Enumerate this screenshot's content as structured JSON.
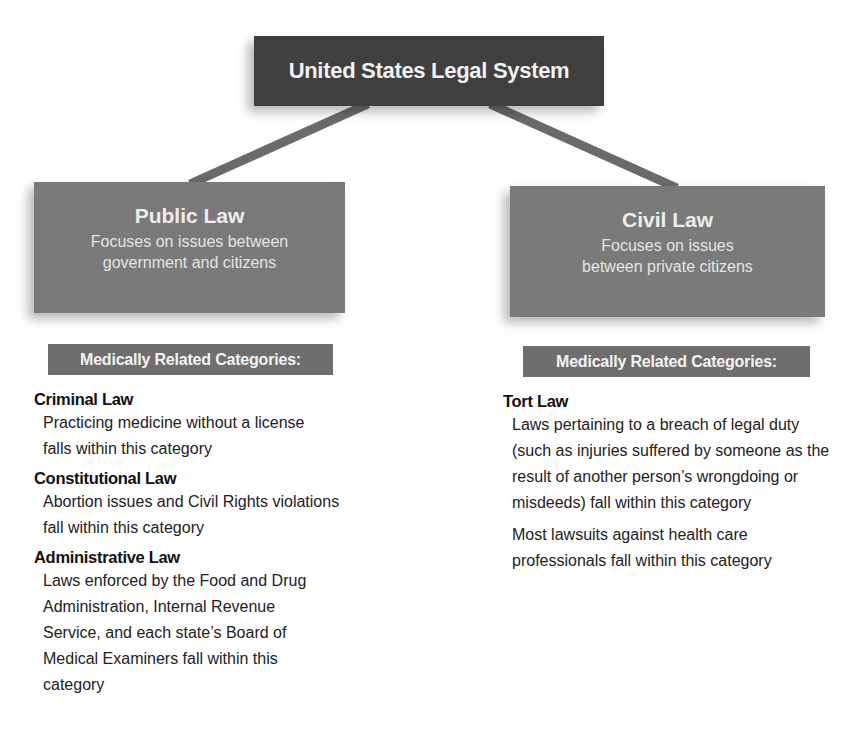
{
  "diagram": {
    "root": {
      "title": "United States Legal System"
    },
    "colors": {
      "root_fill": "#3f3f3f",
      "branch_fill": "#7a7a7a",
      "label_fill": "#6e6e6e",
      "connector": "#6a6a6a"
    },
    "branches": [
      {
        "title": "Public Law",
        "description": "Focuses on issues between government and citizens",
        "categories_label": "Medically Related Categories:",
        "categories": [
          {
            "title": "Criminal Law",
            "descriptions": [
              "Practicing medicine without a license falls within this category"
            ]
          },
          {
            "title": "Constitutional Law",
            "descriptions": [
              "Abortion issues and Civil Rights violations fall within this category"
            ]
          },
          {
            "title": "Administrative Law",
            "descriptions": [
              "Laws enforced by the Food and Drug Administration, Internal Revenue Service, and each state’s Board of Medical Examiners fall within this category"
            ]
          }
        ]
      },
      {
        "title": "Civil Law",
        "description": "Focuses on issues between private citizens",
        "categories_label": "Medically Related Categories:",
        "categories": [
          {
            "title": "Tort Law",
            "descriptions": [
              "Laws pertaining to a breach of legal duty (such as injuries suffered by someone as the result of another person’s wrongdoing or misdeeds) fall within this category",
              "Most lawsuits against health care professionals fall within this category"
            ]
          }
        ]
      }
    ]
  }
}
